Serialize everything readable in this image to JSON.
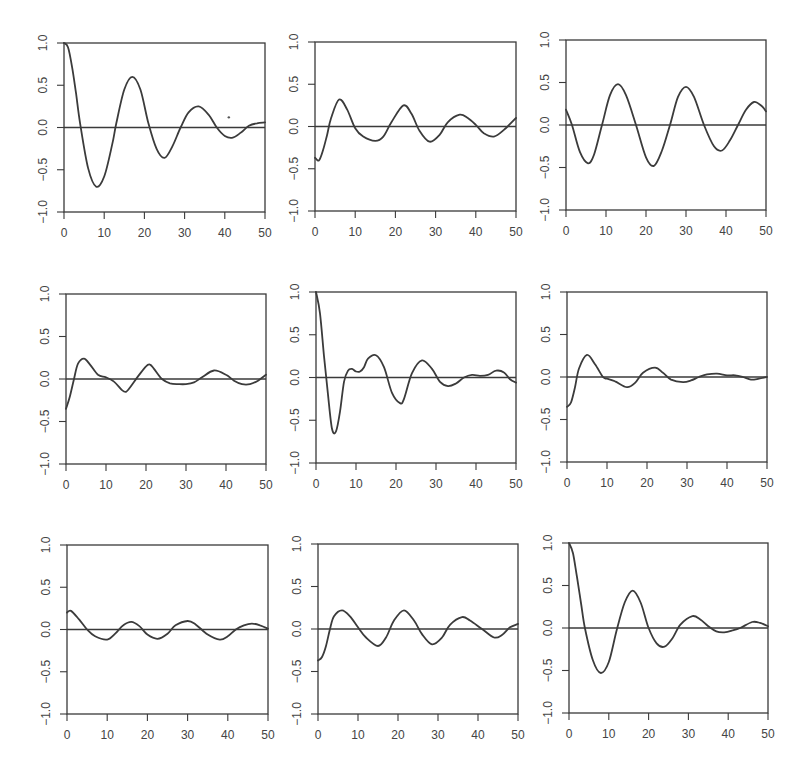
{
  "chart_data": {
    "type": "line",
    "layout": "3x3 grid of panels",
    "title": "",
    "line_color": "#3b3b3b",
    "background": "#ffffff",
    "shared_axes": {
      "xlabel": "",
      "ylabel": "",
      "xlim": [
        0,
        50
      ],
      "ylim": [
        -1.0,
        1.0
      ],
      "xticks": [
        0,
        10,
        20,
        30,
        40,
        50
      ],
      "xtick_labels": [
        "0",
        "10",
        "20",
        "30",
        "40",
        "50"
      ],
      "yticks": [
        -1.0,
        -0.5,
        0.0,
        0.5,
        1.0
      ],
      "ytick_labels": [
        "-1.0",
        "-0.5",
        "0.0",
        "0.5",
        "1.0"
      ],
      "reference_line_y": 0.0,
      "grid": false,
      "legend": false
    },
    "panels": [
      {
        "row": 1,
        "col": 1,
        "frame": {
          "left": 64,
          "right": 265,
          "top": 43,
          "bottom": 212
        },
        "x": [
          0,
          1,
          2,
          3,
          4,
          6,
          8,
          10,
          12,
          13,
          15,
          17,
          19,
          21,
          23,
          25,
          27,
          29,
          31,
          33.5,
          36,
          38,
          40,
          42,
          44,
          46,
          48,
          50
        ],
        "y": [
          1.0,
          0.95,
          0.72,
          0.4,
          0.05,
          -0.48,
          -0.7,
          -0.58,
          -0.2,
          0.05,
          0.45,
          0.6,
          0.45,
          0.05,
          -0.25,
          -0.36,
          -0.22,
          0.0,
          0.18,
          0.25,
          0.15,
          0.0,
          -0.1,
          -0.12,
          -0.06,
          0.02,
          0.05,
          0.06
        ],
        "annotation": {
          "type": "stray-dot",
          "x": 41,
          "y": 0.12
        }
      },
      {
        "row": 1,
        "col": 2,
        "frame": {
          "left": 315,
          "right": 516,
          "top": 42,
          "bottom": 211
        },
        "x": [
          0,
          1,
          2,
          3,
          4,
          6,
          8,
          10,
          12,
          15,
          17,
          19,
          22,
          24,
          26,
          28.5,
          31,
          33,
          36,
          38,
          40,
          42,
          44.5,
          47,
          50
        ],
        "y": [
          -0.37,
          -0.4,
          -0.28,
          -0.1,
          0.1,
          0.32,
          0.2,
          -0.02,
          -0.12,
          -0.17,
          -0.12,
          0.05,
          0.25,
          0.15,
          -0.05,
          -0.18,
          -0.1,
          0.05,
          0.14,
          0.1,
          0.02,
          -0.08,
          -0.12,
          -0.04,
          0.1
        ]
      },
      {
        "row": 1,
        "col": 3,
        "frame": {
          "left": 566,
          "right": 766,
          "top": 40,
          "bottom": 210
        },
        "x": [
          0,
          1.5,
          3.5,
          5.5,
          7,
          9,
          11,
          13,
          15,
          17.5,
          20,
          22,
          24,
          26,
          28,
          30,
          32,
          34.5,
          37,
          39,
          41,
          43,
          45,
          47,
          49,
          50
        ],
        "y": [
          0.18,
          0.0,
          -0.32,
          -0.45,
          -0.35,
          0.0,
          0.35,
          0.48,
          0.35,
          0.0,
          -0.38,
          -0.48,
          -0.3,
          0.0,
          0.33,
          0.45,
          0.33,
          0.0,
          -0.25,
          -0.3,
          -0.18,
          0.0,
          0.18,
          0.27,
          0.22,
          0.16
        ]
      },
      {
        "row": 2,
        "col": 1,
        "frame": {
          "left": 66,
          "right": 266,
          "top": 294,
          "bottom": 464
        },
        "x": [
          0,
          1,
          2,
          3,
          4.5,
          6,
          8,
          10,
          12,
          14,
          15,
          16,
          18,
          20,
          21,
          22,
          24,
          26,
          28,
          30,
          32,
          34,
          37,
          40,
          42,
          44,
          46,
          48,
          50
        ],
        "y": [
          -0.35,
          -0.2,
          0.0,
          0.18,
          0.24,
          0.17,
          0.05,
          0.02,
          -0.03,
          -0.13,
          -0.15,
          -0.1,
          0.03,
          0.15,
          0.17,
          0.12,
          0.0,
          -0.05,
          -0.06,
          -0.06,
          -0.04,
          0.02,
          0.1,
          0.05,
          -0.02,
          -0.06,
          -0.06,
          -0.02,
          0.05
        ]
      },
      {
        "row": 2,
        "col": 2,
        "frame": {
          "left": 316,
          "right": 516,
          "top": 292,
          "bottom": 463
        },
        "x": [
          0,
          1,
          2,
          3,
          4,
          5,
          6,
          7,
          8,
          9,
          10,
          11,
          12,
          13,
          15,
          17,
          19,
          21,
          22,
          24,
          26.5,
          29,
          31,
          33,
          35,
          37,
          39,
          41,
          43,
          45,
          47,
          48.5,
          50
        ],
        "y": [
          1.0,
          0.75,
          0.25,
          -0.2,
          -0.6,
          -0.63,
          -0.4,
          -0.05,
          0.08,
          0.1,
          0.07,
          0.07,
          0.12,
          0.22,
          0.26,
          0.12,
          -0.18,
          -0.3,
          -0.25,
          0.05,
          0.2,
          0.1,
          -0.05,
          -0.1,
          -0.07,
          0.0,
          0.03,
          0.02,
          0.03,
          0.08,
          0.06,
          -0.02,
          -0.06
        ]
      },
      {
        "row": 2,
        "col": 3,
        "frame": {
          "left": 567,
          "right": 767,
          "top": 292,
          "bottom": 462
        },
        "x": [
          0,
          1,
          2,
          3,
          5,
          7,
          9,
          10,
          12,
          15,
          17,
          19,
          22,
          24,
          26,
          29,
          31,
          33,
          35,
          37.5,
          40,
          42,
          44,
          46,
          48,
          50
        ],
        "y": [
          -0.35,
          -0.3,
          -0.12,
          0.1,
          0.26,
          0.15,
          0.0,
          -0.02,
          -0.05,
          -0.12,
          -0.07,
          0.05,
          0.11,
          0.05,
          -0.03,
          -0.06,
          -0.04,
          0.0,
          0.03,
          0.04,
          0.02,
          0.02,
          0.0,
          -0.03,
          -0.02,
          0.0
        ]
      },
      {
        "row": 3,
        "col": 1,
        "frame": {
          "left": 67,
          "right": 268,
          "top": 545,
          "bottom": 714
        },
        "x": [
          0,
          1,
          3,
          5,
          7,
          10,
          12,
          14,
          16,
          18,
          20,
          22.5,
          25,
          27,
          30,
          32,
          35,
          38,
          40,
          42,
          44,
          46,
          48,
          50
        ],
        "y": [
          0.2,
          0.22,
          0.12,
          0.0,
          -0.08,
          -0.12,
          -0.05,
          0.05,
          0.09,
          0.04,
          -0.06,
          -0.11,
          -0.05,
          0.05,
          0.1,
          0.06,
          -0.06,
          -0.12,
          -0.08,
          0.0,
          0.05,
          0.07,
          0.05,
          0.01
        ]
      },
      {
        "row": 3,
        "col": 2,
        "frame": {
          "left": 318,
          "right": 518,
          "top": 544,
          "bottom": 714
        },
        "x": [
          0,
          1,
          2,
          3,
          4,
          6,
          8,
          10,
          12,
          15,
          17,
          19,
          21.5,
          24,
          26,
          28.5,
          31,
          33,
          36,
          38,
          41,
          44,
          46,
          48,
          50
        ],
        "y": [
          -0.37,
          -0.33,
          -0.2,
          0.0,
          0.15,
          0.22,
          0.15,
          0.02,
          -0.1,
          -0.2,
          -0.1,
          0.1,
          0.22,
          0.1,
          -0.06,
          -0.18,
          -0.1,
          0.05,
          0.14,
          0.1,
          0.0,
          -0.1,
          -0.07,
          0.02,
          0.06
        ]
      },
      {
        "row": 3,
        "col": 3,
        "frame": {
          "left": 569,
          "right": 768,
          "top": 543,
          "bottom": 713
        },
        "x": [
          0,
          1,
          2,
          3,
          4,
          6,
          8,
          10,
          12,
          14,
          16,
          18,
          20,
          22,
          24,
          26,
          28,
          31,
          33,
          35,
          37,
          39,
          41,
          43,
          46,
          48,
          50
        ],
        "y": [
          1.0,
          0.88,
          0.6,
          0.3,
          0.0,
          -0.38,
          -0.53,
          -0.4,
          -0.02,
          0.3,
          0.44,
          0.3,
          0.0,
          -0.18,
          -0.22,
          -0.12,
          0.04,
          0.14,
          0.1,
          0.02,
          -0.04,
          -0.05,
          -0.03,
          0.0,
          0.07,
          0.06,
          0.02
        ]
      }
    ]
  }
}
